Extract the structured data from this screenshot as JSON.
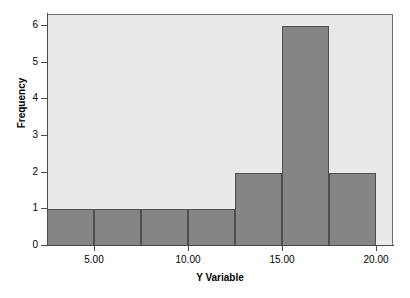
{
  "chart_data": {
    "type": "bar",
    "title": "",
    "subtitle": "",
    "xlabel": "Y Variable",
    "ylabel": "Frequency",
    "xlim": [
      2.5,
      20.9
    ],
    "ylim": [
      0,
      6.3
    ],
    "grid": false,
    "legend": null,
    "bin_width": 2.5,
    "bins": [
      {
        "label": "2.50-5.00",
        "start": 2.5,
        "end": 5.0,
        "value": 1
      },
      {
        "label": "5.00-7.50",
        "start": 5.0,
        "end": 7.5,
        "value": 1
      },
      {
        "label": "7.50-10.00",
        "start": 7.5,
        "end": 10.0,
        "value": 1
      },
      {
        "label": "10.00-12.50",
        "start": 10.0,
        "end": 12.5,
        "value": 1
      },
      {
        "label": "12.50-15.00",
        "start": 12.5,
        "end": 15.0,
        "value": 2
      },
      {
        "label": "15.00-17.50",
        "start": 15.0,
        "end": 17.5,
        "value": 6
      },
      {
        "label": "17.50-20.00",
        "start": 17.5,
        "end": 20.0,
        "value": 2
      }
    ],
    "categories": [
      "2.50-5.00",
      "5.00-7.50",
      "7.50-10.00",
      "10.00-12.50",
      "12.50-15.00",
      "15.00-17.50",
      "17.50-20.00"
    ],
    "values": [
      1,
      1,
      1,
      1,
      2,
      6,
      2
    ],
    "x_ticks": [
      {
        "value": 5,
        "label": "5.00"
      },
      {
        "value": 10,
        "label": "10.00"
      },
      {
        "value": 15,
        "label": "15.00"
      },
      {
        "value": 20,
        "label": "20.00"
      }
    ],
    "y_ticks": [
      {
        "value": 0,
        "label": "0"
      },
      {
        "value": 1,
        "label": "1"
      },
      {
        "value": 2,
        "label": "2"
      },
      {
        "value": 3,
        "label": "3"
      },
      {
        "value": 4,
        "label": "4"
      },
      {
        "value": 5,
        "label": "5"
      },
      {
        "value": 6,
        "label": "6"
      }
    ],
    "colors": {
      "bar_fill": "#858585",
      "bar_border": "#4f4f4f",
      "plot_background": "#e9e9e9",
      "axis_line": "#4a4a4a",
      "page_background": "#ffffff",
      "text": "#000000"
    }
  }
}
